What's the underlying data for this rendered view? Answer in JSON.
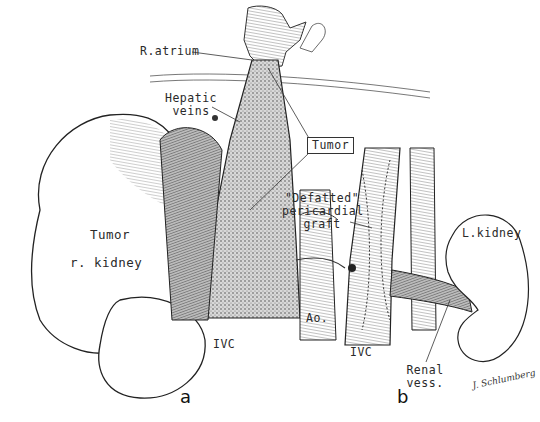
{
  "figure": {
    "panels": [
      {
        "id": "a",
        "label": "a",
        "annotations": {
          "r_atrium": "R.atrium",
          "hepatic_veins_1": "Hepatic",
          "hepatic_veins_2": "veins",
          "tumor_box": "Tumor",
          "tumor_kidney_1": "Tumor",
          "tumor_kidney_2": "r. kidney",
          "ivc": "IVC",
          "aorta": "Ao."
        }
      },
      {
        "id": "b",
        "label": "b",
        "annotations": {
          "graft_1": "\"Defatted\"",
          "graft_2": "pericardial",
          "graft_3": "graft",
          "l_kidney": "L.kidney",
          "ivc": "IVC",
          "renal_vess_1": "Renal",
          "renal_vess_2": "vess."
        }
      }
    ],
    "signature": "J. Schlumberg"
  }
}
